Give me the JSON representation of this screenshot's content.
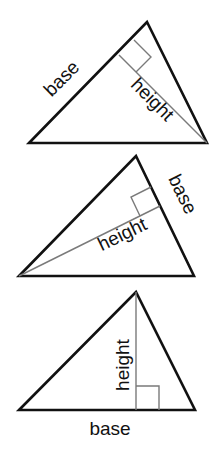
{
  "diagram": {
    "colors": {
      "side": "#111111",
      "altitude": "#7a7a7a",
      "background": "#ffffff"
    },
    "triangles": [
      {
        "id": "triangle-1",
        "base_label": "base",
        "height_label": "height",
        "base_side": "left side",
        "vertices": [
          [
            29,
            143
          ],
          [
            147,
            22
          ],
          [
            207,
            143
          ]
        ],
        "height_line": [
          [
            207,
            143
          ],
          [
            119,
            55
          ]
        ],
        "right_angle_box": [
          [
            119,
            55
          ],
          [
            134,
            40
          ],
          [
            151,
            57
          ],
          [
            136,
            72
          ]
        ]
      },
      {
        "id": "triangle-2",
        "base_label": "base",
        "height_label": "height",
        "base_side": "right side",
        "vertices": [
          [
            19,
            276
          ],
          [
            136,
            156
          ],
          [
            194,
            276
          ]
        ],
        "height_line": [
          [
            19,
            276
          ],
          [
            160,
            206
          ]
        ],
        "right_angle_box": [
          [
            160,
            206
          ],
          [
            151,
            187
          ],
          [
            131,
            197
          ],
          [
            140,
            216
          ]
        ]
      },
      {
        "id": "triangle-3",
        "base_label": "base",
        "height_label": "height",
        "base_side": "bottom",
        "vertices": [
          [
            19,
            410
          ],
          [
            136,
            292
          ],
          [
            195,
            410
          ]
        ],
        "height_line": [
          [
            136,
            292
          ],
          [
            136,
            410
          ]
        ],
        "right_angle_box": [
          [
            136,
            386
          ],
          [
            159,
            386
          ],
          [
            159,
            410
          ],
          [
            136,
            410
          ]
        ]
      }
    ]
  }
}
